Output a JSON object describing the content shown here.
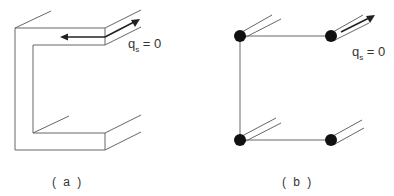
{
  "figure_a": {
    "caption": "( a )",
    "label_q": "q",
    "label_sub": "s",
    "label_eq": "= 0",
    "description": "Open thin-walled channel section with shear flow arrows at flange free edge"
  },
  "figure_b": {
    "caption": "( b )",
    "label_q": "q",
    "label_sub": "s",
    "label_eq": "= 0",
    "description": "Idealized channel section with four booms"
  },
  "colors": {
    "line": "#555555",
    "arrow": "#222222",
    "boom": "#111111"
  }
}
